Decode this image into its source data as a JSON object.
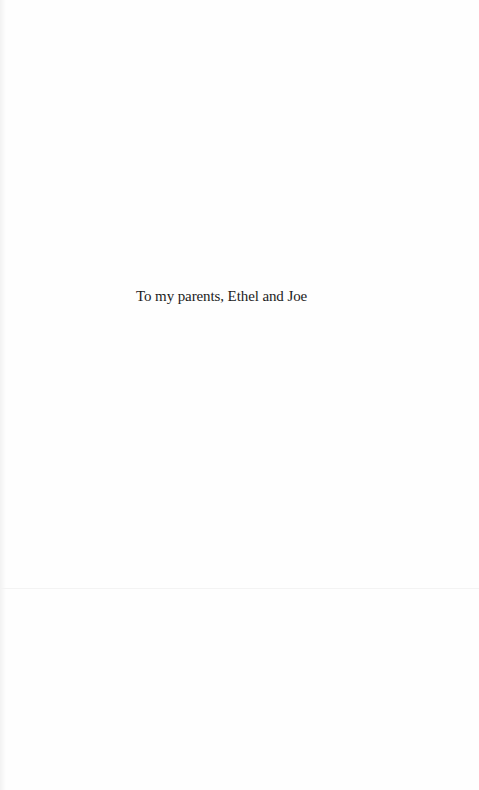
{
  "page": {
    "type": "dedication",
    "background_color": "#fefefe",
    "text_color": "#1c1c1c"
  },
  "dedication": {
    "text": "To my parents, Ethel and Joe"
  }
}
